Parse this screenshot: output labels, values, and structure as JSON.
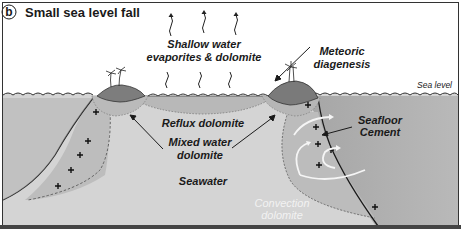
{
  "panel": {
    "letter": "b",
    "title": "Small sea level fall"
  },
  "labels": {
    "shallow_water_line1": "Shallow water",
    "shallow_water_line2": "evaporites & dolomite",
    "meteoric_line1": "Meteoric",
    "meteoric_line2": "diagenesis",
    "sea_level": "Sea level",
    "reflux": "Reflux dolomite",
    "mixed_line1": "Mixed water",
    "mixed_line2": "dolomite",
    "seafloor_line1": "Seafloor",
    "seafloor_line2": "Cement",
    "seawater": "Seawater",
    "convection_line1": "Convection",
    "convection_line2": "dolomite"
  },
  "colors": {
    "background": "#ffffff",
    "seawater": "#d4d4d4",
    "platform_deep": "#a8a8a8",
    "zone_medium": "#bdbdbd",
    "island": "#7d7d7d",
    "lens": "#b4b4b4",
    "line": "#1a1a1a",
    "convection_text": "#f2f2f2",
    "frame": "#333333"
  }
}
